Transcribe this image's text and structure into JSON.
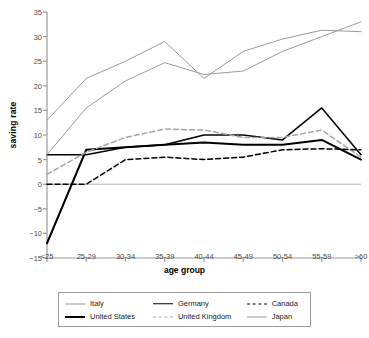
{
  "chart_data": {
    "type": "line",
    "title": "",
    "xlabel": "age group",
    "ylabel": "saving rate",
    "categories": [
      "<25",
      "25-29",
      "30-34",
      "35-39",
      "40-44",
      "45-49",
      "50-54",
      "55-59",
      ">60"
    ],
    "ylim": [
      -15,
      35
    ],
    "yticks": [
      35,
      30,
      25,
      20,
      15,
      10,
      5,
      0,
      -5,
      -10,
      -15
    ],
    "grid": false,
    "legend_position": "bottom",
    "series": [
      {
        "name": "Italy",
        "color": "#9a9a9a",
        "style": "solid",
        "width": "thin",
        "values": [
          13,
          21.5,
          25,
          29,
          21.5,
          27,
          29.5,
          31.3,
          31
        ]
      },
      {
        "name": "United States",
        "color": "#000000",
        "style": "solid",
        "width": "thick",
        "values": [
          -12,
          7,
          7.5,
          8,
          8.5,
          8,
          8,
          9,
          5
        ]
      },
      {
        "name": "Germany",
        "color": "#000000",
        "style": "solid",
        "width": "medium",
        "values": [
          6,
          6,
          7.5,
          8,
          10,
          10,
          9,
          15.5,
          6
        ]
      },
      {
        "name": "United Kingdom",
        "color": "#a6a6a6",
        "style": "dashed",
        "width": "medium",
        "values": [
          2,
          6.5,
          9.5,
          11.2,
          11,
          9.5,
          9.5,
          11,
          5.5
        ]
      },
      {
        "name": "Canada",
        "color": "#000000",
        "style": "dashed",
        "width": "medium",
        "values": [
          0,
          0,
          5,
          5.5,
          5,
          5.5,
          7,
          7.2,
          7
        ]
      },
      {
        "name": "Japan",
        "color": "#9a9a9a",
        "style": "solid",
        "width": "thin",
        "values": [
          6,
          15.5,
          21,
          24.7,
          22.3,
          23,
          27,
          30,
          33
        ]
      }
    ]
  },
  "legend": {
    "items": [
      {
        "label": "Italy"
      },
      {
        "label": "Germany"
      },
      {
        "label": "Canada"
      },
      {
        "label": "United States"
      },
      {
        "label": "United Kingdom"
      },
      {
        "label": "Japan"
      }
    ]
  },
  "axes": {
    "zero_line_visible": true,
    "axis_color": "#9a9a9a"
  }
}
